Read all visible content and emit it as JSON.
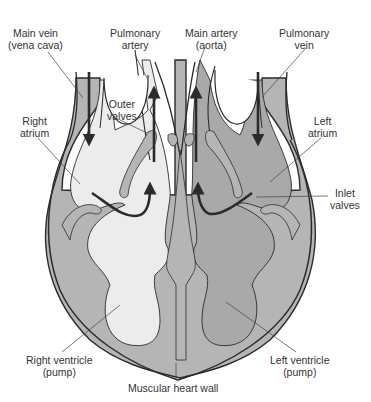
{
  "diagram": {
    "colors": {
      "background": "#ffffff",
      "muscle_wall": "#b5b5b5",
      "right_side_blood": "#ececec",
      "left_side_blood": "#a9a9a9",
      "outline": "#2b2b2b",
      "arrow": "#2b2b2b",
      "label_text": "#333333"
    },
    "labels": {
      "main_vein": {
        "line1": "Main vein",
        "line2": "(vena cava)"
      },
      "pulmonary_artery": {
        "line1": "Pulmonary",
        "line2": "artery"
      },
      "main_artery": {
        "line1": "Main artery",
        "line2": "(aorta)"
      },
      "pulmonary_vein": {
        "line1": "Pulmonary",
        "line2": "vein"
      },
      "outer_valves": {
        "line1": "Outer",
        "line2": "valves"
      },
      "right_atrium": {
        "line1": "Right",
        "line2": "atrium"
      },
      "left_atrium": {
        "line1": "Left",
        "line2": "atrium"
      },
      "inlet_valves": {
        "line1": "Inlet",
        "line2": "valves"
      },
      "right_ventricle": {
        "line1": "Right ventricle",
        "line2": "(pump)"
      },
      "left_ventricle": {
        "line1": "Left ventricle",
        "line2": "(pump)"
      },
      "muscular_heart_wall": {
        "line1": "Muscular heart wall"
      }
    },
    "arrows": [
      {
        "name": "vena-cava-inflow",
        "direction": "down"
      },
      {
        "name": "pulmonary-artery-outflow",
        "direction": "up"
      },
      {
        "name": "aorta-outflow",
        "direction": "up"
      },
      {
        "name": "pulmonary-vein-inflow",
        "direction": "down"
      },
      {
        "name": "right-atrium-to-ventricle",
        "direction": "curved-up"
      },
      {
        "name": "left-atrium-to-ventricle",
        "direction": "curved-up"
      }
    ]
  }
}
